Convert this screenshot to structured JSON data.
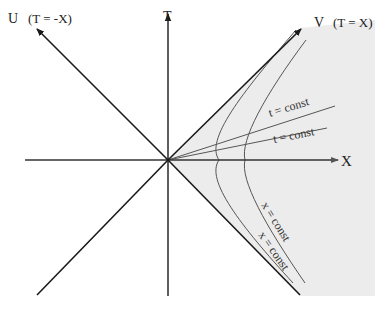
{
  "diagram": {
    "axes": {
      "T": "T",
      "X": "X",
      "U": "U",
      "U_eq": "(T = -X)",
      "V": "V",
      "V_eq": "(T = X)"
    },
    "curves": {
      "t_const_1": "t = const",
      "t_const_2": "t = const",
      "x_const_1": "x = const",
      "x_const_2": "x = const"
    },
    "colors": {
      "ink": "#1a1a1a",
      "curve": "#555555",
      "shading": "#ededed"
    }
  }
}
